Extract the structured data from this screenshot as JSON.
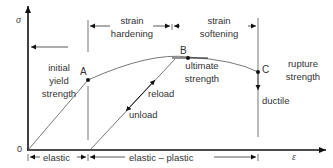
{
  "diagram": {
    "axes": {
      "y_symbol": "σ",
      "x_symbol": "ε",
      "origin": "0"
    },
    "points": {
      "A": "A",
      "B": "B",
      "C": "C"
    },
    "labels": {
      "initial_yield_1": "initial",
      "initial_yield_2": "yield",
      "initial_yield_3": "strength",
      "ultimate_1": "ultimate",
      "ultimate_2": "strength",
      "rupture_1": "rupture",
      "rupture_2": "strength",
      "reload": "reload",
      "unload": "unload",
      "ductile": "ductile"
    },
    "regions_top": {
      "hardening_1": "strain",
      "hardening_2": "hardening",
      "softening_1": "strain",
      "softening_2": "softening"
    },
    "regions_bottom": {
      "elastic": "elastic",
      "elastic_plastic": "elastic – plastic"
    }
  }
}
